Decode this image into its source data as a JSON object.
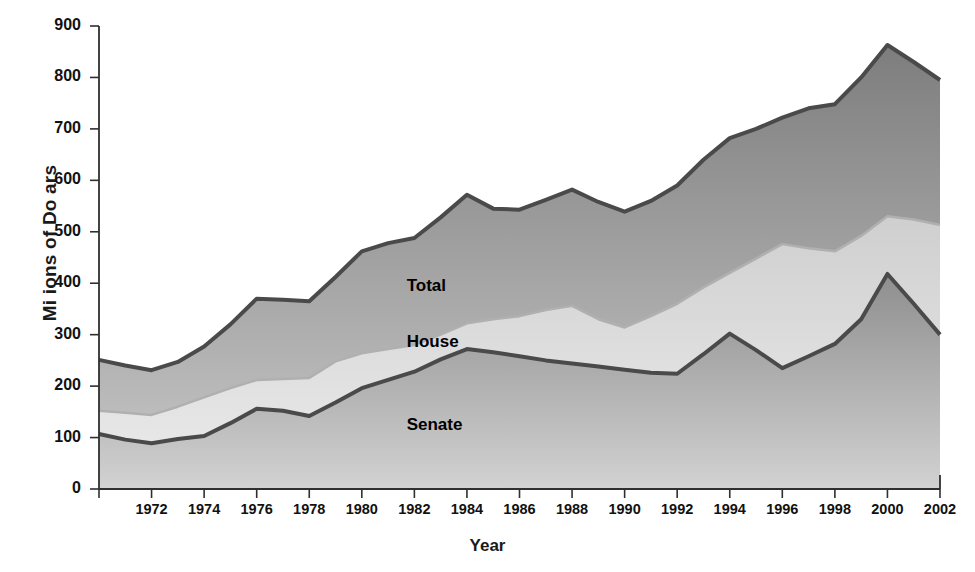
{
  "chart_data": {
    "type": "area",
    "stacked": false,
    "title": "",
    "xlabel": "Year",
    "ylabel": "Mi ions of Do ars",
    "xlim": [
      1970,
      2002
    ],
    "ylim": [
      0,
      900
    ],
    "grid": false,
    "legend_position": "inline-annotations",
    "x": [
      1970,
      1971,
      1972,
      1973,
      1974,
      1975,
      1976,
      1977,
      1978,
      1979,
      1980,
      1981,
      1982,
      1983,
      1984,
      1985,
      1986,
      1987,
      1988,
      1989,
      1990,
      1991,
      1992,
      1993,
      1994,
      1995,
      1996,
      1997,
      1998,
      1999,
      2000,
      2001,
      2002
    ],
    "x_ticks": [
      1972,
      1974,
      1976,
      1978,
      1980,
      1982,
      1984,
      1986,
      1988,
      1990,
      1992,
      1994,
      1996,
      1998,
      2000,
      2002
    ],
    "x_tick_labels": [
      "1972",
      "1974",
      "1976",
      "1978",
      "1980",
      "1982",
      "1984",
      "1986",
      "1988",
      "1990",
      "1992",
      "1994",
      "1996",
      "1998",
      "2000",
      "2002"
    ],
    "y_ticks": [
      0,
      100,
      200,
      300,
      400,
      500,
      600,
      700,
      800,
      900
    ],
    "y_tick_labels": [
      "0",
      "100",
      "200",
      "300",
      "400",
      "500",
      "600",
      "700",
      "800",
      "900"
    ],
    "series": [
      {
        "name": "Total",
        "label": "Total",
        "color": "#8d8d8d",
        "line_color": "#4a4a4a",
        "values": [
          251,
          240,
          231,
          247,
          277,
          320,
          370,
          368,
          365,
          412,
          462,
          478,
          488,
          528,
          572,
          545,
          543,
          562,
          582,
          558,
          539,
          560,
          590,
          640,
          682,
          700,
          722,
          740,
          748,
          800,
          863,
          830,
          795
        ]
      },
      {
        "name": "House",
        "label": "House",
        "color": "#d9d9d9",
        "line_color": "#b0b0b0",
        "values": [
          152,
          148,
          144,
          160,
          178,
          196,
          212,
          214,
          216,
          248,
          264,
          272,
          280,
          300,
          322,
          330,
          336,
          348,
          356,
          330,
          314,
          336,
          360,
          392,
          420,
          448,
          476,
          468,
          462,
          492,
          530,
          524,
          513
        ]
      },
      {
        "name": "Senate",
        "label": "Senate",
        "color": "#9a9a9a",
        "line_color": "#4a4a4a",
        "values": [
          107,
          96,
          89,
          97,
          103,
          128,
          156,
          152,
          142,
          168,
          196,
          212,
          228,
          252,
          272,
          266,
          258,
          250,
          244,
          238,
          232,
          226,
          224,
          262,
          302,
          270,
          235,
          258,
          282,
          330,
          418,
          360,
          300
        ]
      }
    ],
    "annotations": [
      {
        "text": "Total",
        "x": 1983,
        "y": 392
      },
      {
        "text": "House",
        "x": 1983,
        "y": 283
      },
      {
        "text": "Senate",
        "x": 1983,
        "y": 122
      }
    ]
  },
  "axis": {
    "x_title": "Year",
    "y_title": "Mi ions of Do ars"
  },
  "caption": {
    "partial_text": ""
  }
}
